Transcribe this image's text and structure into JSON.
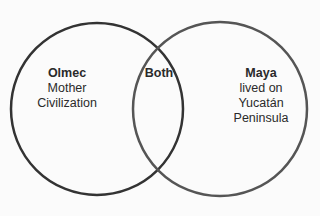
{
  "diagram": {
    "type": "venn",
    "sets": [
      {
        "title": "Olmec",
        "lines": [
          "Mother",
          "Civilization"
        ],
        "stroke": "#333333"
      },
      {
        "title": "Maya",
        "lines": [
          "lived on",
          "Yucatán",
          "Peninsula"
        ],
        "stroke": "#555555"
      }
    ],
    "overlap": {
      "title": "Both"
    }
  }
}
